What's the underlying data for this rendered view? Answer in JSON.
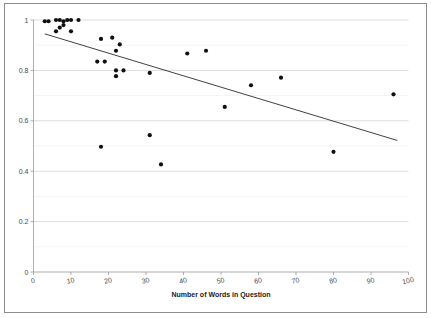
{
  "chart_data": {
    "type": "scatter",
    "title": "",
    "subtitle": "",
    "xlabel": "Number of Words in Question",
    "ylabel": "",
    "xlim": [
      0,
      100
    ],
    "ylim": [
      0,
      1
    ],
    "xticks": [
      0,
      10,
      20,
      30,
      40,
      50,
      60,
      70,
      80,
      90,
      100
    ],
    "xtick_labels": [
      "0",
      "10",
      "20",
      "30",
      "40",
      "50",
      "60",
      "70",
      "80",
      "90",
      "100"
    ],
    "yticks": [
      0,
      0.2,
      0.4,
      0.6,
      0.8,
      1
    ],
    "ytick_labels": [
      "0",
      "0.2",
      "0.4",
      "0.6",
      "0.8",
      "1"
    ],
    "grid": true,
    "grid_major_y": [
      0,
      0.2,
      0.4,
      0.6,
      0.8,
      1
    ],
    "grid_minor_y": [
      0.1,
      0.3,
      0.5,
      0.7,
      0.9
    ],
    "legend": false,
    "legend_position": "none",
    "marker_color": "#101010",
    "marker_shape": "circle",
    "marker_size": 2.1,
    "trendline_color": "#2b2b2b",
    "series": [
      {
        "name": "Accuracy vs Question Length",
        "x": [
          3,
          4,
          6,
          6,
          7,
          7,
          8,
          8,
          9,
          10,
          10,
          12,
          17,
          18,
          18,
          19,
          21,
          22,
          22,
          22,
          23,
          24,
          31,
          31,
          34,
          41,
          46,
          51,
          58,
          66,
          80,
          96
        ],
        "y": [
          0.995,
          0.995,
          0.955,
          1.0,
          1.0,
          0.97,
          0.995,
          0.98,
          1.0,
          1.0,
          0.955,
          1.0,
          0.835,
          0.925,
          0.497,
          0.835,
          0.93,
          0.878,
          0.777,
          0.8,
          0.903,
          0.8,
          0.79,
          0.543,
          0.427,
          0.867,
          0.878,
          0.655,
          0.741,
          0.771,
          0.477,
          0.705
        ]
      }
    ],
    "trendline": {
      "name": "Linear trend",
      "x_start": 3,
      "y_start": 0.945,
      "x_end": 97,
      "y_end": 0.522,
      "slope": -0.0045,
      "intercept": 0.9585
    }
  },
  "figure": {
    "background_color": "#ffffff",
    "frame_color": "#8c8c8c"
  }
}
